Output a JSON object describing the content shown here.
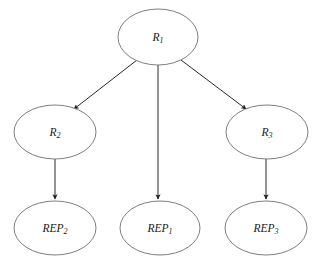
{
  "diagram": {
    "type": "directed-tree",
    "colors": {
      "background": "#ffffff",
      "node_stroke": "#6f6f6f",
      "node_fill": "#ffffff",
      "edge_stroke": "#2a2a2a",
      "label_text": "#1a1a1a"
    },
    "nodes": [
      {
        "id": "R1",
        "base": "R",
        "subscript": "1",
        "cx": 158,
        "cy": 37,
        "rx": 40,
        "ry": 28,
        "level": "root"
      },
      {
        "id": "R2",
        "base": "R",
        "subscript": "2",
        "cx": 55,
        "cy": 132,
        "rx": 41,
        "ry": 27,
        "level": "middle"
      },
      {
        "id": "R3",
        "base": "R",
        "subscript": "3",
        "cx": 267,
        "cy": 132,
        "rx": 41,
        "ry": 27,
        "level": "middle"
      },
      {
        "id": "REP2",
        "base": "REP",
        "subscript": "2",
        "cx": 55,
        "cy": 228,
        "rx": 41,
        "ry": 27,
        "level": "leaf"
      },
      {
        "id": "REP1",
        "base": "REP",
        "subscript": "1",
        "cx": 160,
        "cy": 228,
        "rx": 40,
        "ry": 27,
        "level": "leaf"
      },
      {
        "id": "REP3",
        "base": "REP",
        "subscript": "3",
        "cx": 266,
        "cy": 228,
        "rx": 41,
        "ry": 27,
        "level": "leaf"
      }
    ],
    "edges": [
      {
        "id": "R1-R2",
        "from": "R1",
        "to": "R2",
        "x1": 137,
        "y1": 60,
        "x2": 74,
        "y2": 109,
        "direction": "down-left"
      },
      {
        "id": "R1-REP1",
        "from": "R1",
        "to": "REP1",
        "x1": 158,
        "y1": 65,
        "x2": 158,
        "y2": 199,
        "direction": "down"
      },
      {
        "id": "R1-R3",
        "from": "R1",
        "to": "R3",
        "x1": 181,
        "y1": 60,
        "x2": 246,
        "y2": 109,
        "direction": "down-right"
      },
      {
        "id": "R2-REP2",
        "from": "R2",
        "to": "REP2",
        "x1": 55,
        "y1": 159,
        "x2": 55,
        "y2": 199,
        "direction": "down"
      },
      {
        "id": "R3-REP3",
        "from": "R3",
        "to": "REP3",
        "x1": 266,
        "y1": 159,
        "x2": 266,
        "y2": 199,
        "direction": "down"
      }
    ]
  }
}
